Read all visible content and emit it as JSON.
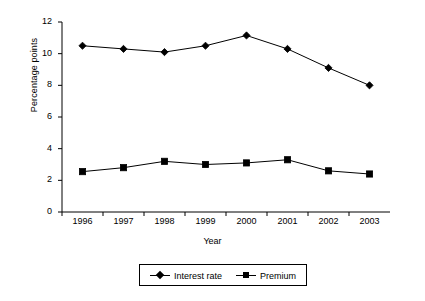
{
  "chart_data": {
    "type": "line",
    "title": "",
    "xlabel": "Year",
    "ylabel": "Percentage points",
    "categories": [
      "1996",
      "1997",
      "1998",
      "1999",
      "2000",
      "2001",
      "2002",
      "2003"
    ],
    "x": [
      1996,
      1997,
      1998,
      1999,
      2000,
      2001,
      2002,
      2003
    ],
    "series": [
      {
        "name": "Interest rate",
        "marker": "diamond",
        "color": "#000000",
        "values": [
          10.5,
          10.3,
          10.1,
          10.5,
          11.15,
          10.3,
          9.1,
          8.0
        ]
      },
      {
        "name": "Premium",
        "marker": "square",
        "color": "#000000",
        "values": [
          2.55,
          2.8,
          3.2,
          3.0,
          3.1,
          3.3,
          2.6,
          2.4
        ]
      }
    ],
    "ylim": [
      0,
      12
    ],
    "yticks": [
      "0",
      "2",
      "4",
      "6",
      "8",
      "10",
      "12"
    ],
    "ytick_values": [
      0,
      2,
      4,
      6,
      8,
      10,
      12
    ],
    "grid": false,
    "legend_position": "bottom"
  },
  "legend": {
    "entries": [
      {
        "label": "Interest rate"
      },
      {
        "label": "Premium"
      }
    ]
  },
  "axes": {
    "x_title": "Year",
    "y_title": "Percentage points"
  }
}
